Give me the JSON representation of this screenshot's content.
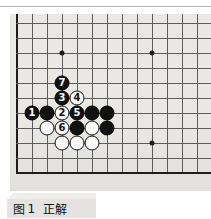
{
  "figure": {
    "caption_prefix": "图",
    "caption_number": "1",
    "caption_title": "正解",
    "caption_full": "图 1  正解"
  },
  "board": {
    "type": "go-board",
    "kind": "corner-diagram",
    "columns_visible": 13,
    "rows_visible": 12,
    "cell_px": 15,
    "origin_x_px": 17,
    "origin_y_px": 8,
    "left_edge_is_board_edge": true,
    "bottom_edge_is_board_edge": true,
    "top_is_cropped": true,
    "right_is_cropped": true,
    "background_color": "#e9e7e1",
    "line_color": "#5c5c5c",
    "edge_color": "#1c1c1c",
    "black_stone_color": "#121212",
    "white_stone_color": "#fbfbfb",
    "star_points": [
      {
        "col": 3,
        "row": 3
      },
      {
        "col": 9,
        "row": 3
      },
      {
        "col": 9,
        "row": 9
      }
    ],
    "stones": [
      {
        "col": 1,
        "row": 7,
        "color": "black",
        "label": "1"
      },
      {
        "col": 2,
        "row": 7,
        "color": "black",
        "label": ""
      },
      {
        "col": 3,
        "row": 7,
        "color": "white",
        "label": "2"
      },
      {
        "col": 4,
        "row": 7,
        "color": "black",
        "label": "5"
      },
      {
        "col": 5,
        "row": 7,
        "color": "black",
        "label": ""
      },
      {
        "col": 6,
        "row": 7,
        "color": "black",
        "label": ""
      },
      {
        "col": 3,
        "row": 6,
        "color": "black",
        "label": "3"
      },
      {
        "col": 4,
        "row": 6,
        "color": "white",
        "label": "4"
      },
      {
        "col": 3,
        "row": 5,
        "color": "black",
        "label": "7"
      },
      {
        "col": 2,
        "row": 8,
        "color": "white",
        "label": ""
      },
      {
        "col": 3,
        "row": 8,
        "color": "white",
        "label": "6"
      },
      {
        "col": 4,
        "row": 8,
        "color": "black",
        "label": ""
      },
      {
        "col": 5,
        "row": 8,
        "color": "white",
        "label": ""
      },
      {
        "col": 6,
        "row": 8,
        "color": "black",
        "label": ""
      },
      {
        "col": 3,
        "row": 9,
        "color": "white",
        "label": ""
      },
      {
        "col": 4,
        "row": 9,
        "color": "white",
        "label": ""
      },
      {
        "col": 5,
        "row": 9,
        "color": "white",
        "label": ""
      }
    ],
    "move_sequence": [
      {
        "n": "1",
        "color": "black"
      },
      {
        "n": "2",
        "color": "white"
      },
      {
        "n": "3",
        "color": "black"
      },
      {
        "n": "4",
        "color": "white"
      },
      {
        "n": "5",
        "color": "black"
      },
      {
        "n": "6",
        "color": "white"
      },
      {
        "n": "7",
        "color": "black"
      }
    ]
  }
}
